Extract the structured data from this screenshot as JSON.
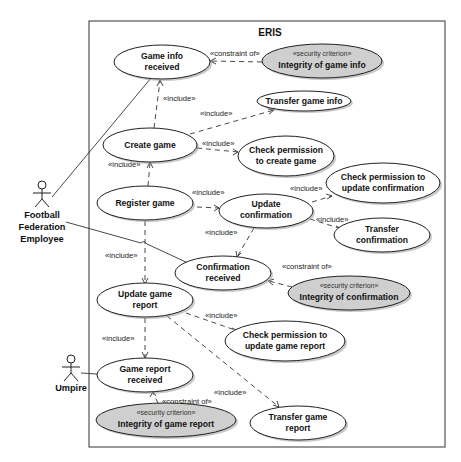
{
  "diagram": {
    "type": "uml-use-case",
    "system": {
      "title": "ERIS"
    },
    "colors": {
      "use_case_fill": "#ffffff",
      "security_criterion_fill": "#cfcfcf",
      "stroke": "#222222"
    },
    "actors": [
      {
        "id": "ffe",
        "name_lines": [
          "Football",
          "Federation",
          "Employee"
        ]
      },
      {
        "id": "umpire",
        "name_lines": [
          "Umpire"
        ]
      }
    ],
    "use_cases": {
      "game_info_received": {
        "lines": [
          "Game info",
          "received"
        ]
      },
      "integrity_game_info": {
        "stereotype": "«security criterion»",
        "lines": [
          "Integrity of game info"
        ]
      },
      "transfer_game_info": {
        "lines": [
          "Transfer game info"
        ]
      },
      "create_game": {
        "lines": [
          "Create game"
        ]
      },
      "check_perm_create": {
        "lines": [
          "Check permission",
          "to create game"
        ]
      },
      "register_game": {
        "lines": [
          "Register game"
        ]
      },
      "update_confirmation": {
        "lines": [
          "Update",
          "confirmation"
        ]
      },
      "check_perm_update_conf": {
        "lines": [
          "Check permission to",
          "update confirmation"
        ]
      },
      "transfer_confirmation": {
        "lines": [
          "Transfer",
          "confirmation"
        ]
      },
      "confirmation_received": {
        "lines": [
          "Confirmation",
          "received"
        ]
      },
      "integrity_confirmation": {
        "stereotype": "«security criterion»",
        "lines": [
          "Integrity of confirmation"
        ]
      },
      "update_game_report": {
        "lines": [
          "Update game",
          "report"
        ]
      },
      "check_perm_update_report": {
        "lines": [
          "Check permission to",
          "update game report"
        ]
      },
      "game_report_received": {
        "lines": [
          "Game report",
          "received"
        ]
      },
      "integrity_game_report": {
        "stereotype": "«security criterion»",
        "lines": [
          "Integrity of game report"
        ]
      },
      "transfer_game_report": {
        "lines": [
          "Transfer game",
          "report"
        ]
      }
    },
    "relationship_labels": {
      "include": "«include»",
      "constraint_of": "«constraint of»"
    },
    "relationships": [
      {
        "from": "create_game",
        "to": "game_info_received",
        "label": "«include»"
      },
      {
        "from": "create_game",
        "to": "transfer_game_info",
        "label": "«include»"
      },
      {
        "from": "create_game",
        "to": "check_perm_create",
        "label": "«include»"
      },
      {
        "from": "register_game",
        "to": "create_game",
        "label": "«include»"
      },
      {
        "from": "register_game",
        "to": "update_confirmation",
        "label": "«include»"
      },
      {
        "from": "register_game",
        "to": "update_game_report",
        "label": "«include»"
      },
      {
        "from": "update_confirmation",
        "to": "check_perm_update_conf",
        "label": "«include»"
      },
      {
        "from": "update_confirmation",
        "to": "transfer_confirmation",
        "label": "«include»"
      },
      {
        "from": "update_confirmation",
        "to": "confirmation_received",
        "label": "«include»"
      },
      {
        "from": "update_game_report",
        "to": "check_perm_update_report",
        "label": "«include»"
      },
      {
        "from": "update_game_report",
        "to": "game_report_received",
        "label": "«include»"
      },
      {
        "from": "update_game_report",
        "to": "transfer_game_report",
        "label": "«include»"
      },
      {
        "from": "integrity_game_info",
        "to": "game_info_received",
        "label": "«constraint of»"
      },
      {
        "from": "integrity_confirmation",
        "to": "confirmation_received",
        "label": "«constraint of»"
      },
      {
        "from": "integrity_game_report",
        "to": "game_report_received",
        "label": "«constraint of»"
      },
      {
        "from": "ffe",
        "to": "game_info_received",
        "label": ""
      },
      {
        "from": "ffe",
        "to": "confirmation_received",
        "label": ""
      },
      {
        "from": "umpire",
        "to": "game_report_received",
        "label": ""
      }
    ]
  }
}
